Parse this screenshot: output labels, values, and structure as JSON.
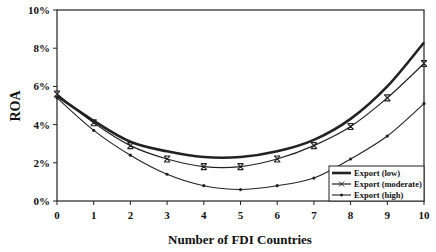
{
  "chart_data": {
    "type": "line",
    "title": "",
    "xlabel": "Number of FDI Countries",
    "ylabel": "ROA",
    "x": [
      0,
      1,
      2,
      3,
      4,
      5,
      6,
      7,
      8,
      9,
      10
    ],
    "y_ticks": [
      "0%",
      "2%",
      "4%",
      "6%",
      "8%",
      "10%"
    ],
    "ylim": [
      0,
      10
    ],
    "grid": false,
    "legend_position": "lower right",
    "series": [
      {
        "name": "Export (low)",
        "marker": "none",
        "values": [
          5.5,
          4.2,
          3.1,
          2.6,
          2.3,
          2.3,
          2.6,
          3.2,
          4.3,
          6.0,
          8.3
        ]
      },
      {
        "name": "Export (moderate)",
        "marker": "x",
        "values": [
          5.6,
          4.1,
          2.9,
          2.2,
          1.8,
          1.8,
          2.2,
          2.9,
          3.9,
          5.4,
          7.2
        ]
      },
      {
        "name": "Export (high)",
        "marker": "dot",
        "values": [
          5.4,
          3.7,
          2.4,
          1.4,
          0.8,
          0.6,
          0.8,
          1.2,
          2.2,
          3.4,
          5.1
        ]
      }
    ]
  }
}
